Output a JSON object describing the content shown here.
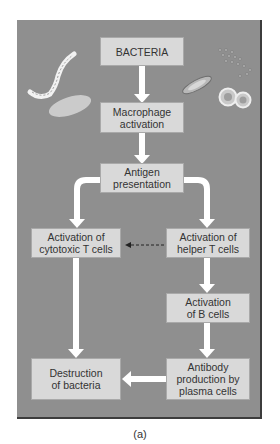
{
  "figure": {
    "caption": "(a)",
    "colors": {
      "panel_background": "#8f8f8f",
      "box_fill": "#d9d9d9",
      "arrow": "#ffffff",
      "dashed_arrow": "#2a2a2a"
    }
  },
  "nodes": {
    "bacteria": "BACTERIA",
    "macrophage": "Macrophage\nactivation",
    "antigen": "Antigen\npresentation",
    "cytotoxic": "Activation of\ncytotoxic T cells",
    "helper": "Activation of\nhelper T cells",
    "bcells": "Activation\nof B cells",
    "antibody": "Antibody\nproduction by\nplasma cells",
    "destruction": "Destruction\nof bacteria"
  },
  "edges": [
    {
      "from": "bacteria",
      "to": "macrophage",
      "style": "solid"
    },
    {
      "from": "macrophage",
      "to": "antigen",
      "style": "solid"
    },
    {
      "from": "antigen",
      "to": "cytotoxic",
      "style": "solid"
    },
    {
      "from": "antigen",
      "to": "helper",
      "style": "solid"
    },
    {
      "from": "helper",
      "to": "cytotoxic",
      "style": "dashed"
    },
    {
      "from": "helper",
      "to": "bcells",
      "style": "solid"
    },
    {
      "from": "bcells",
      "to": "antibody",
      "style": "solid"
    },
    {
      "from": "cytotoxic",
      "to": "destruction",
      "style": "solid"
    },
    {
      "from": "antibody",
      "to": "destruction",
      "style": "solid"
    }
  ],
  "illustrations": [
    "spirochete-bacterium",
    "rod-bacterium",
    "bacillus-with-flagella",
    "coccus-cluster",
    "diplococcus"
  ]
}
